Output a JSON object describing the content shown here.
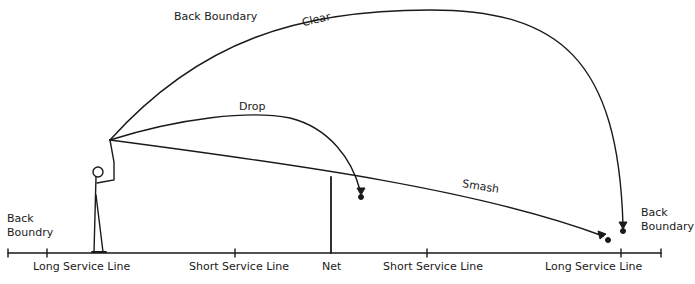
{
  "diagram": {
    "type": "badminton-shot-trajectories",
    "line_color": "#1a1a1a",
    "background": "#ffffff",
    "shots": [
      {
        "name": "Clear",
        "label": "Clear"
      },
      {
        "name": "Drop",
        "label": "Drop"
      },
      {
        "name": "Smash",
        "label": "Smash"
      }
    ],
    "labels": {
      "back_boundary_top": "Back Boundary",
      "back_boundary_left": "Back\nBoundry",
      "back_boundary_right": "Back\nBoundary",
      "clear": "Clear",
      "drop": "Drop",
      "smash": "Smash"
    },
    "court_lines": [
      {
        "label": "Long Service Line"
      },
      {
        "label": "Short Service Line"
      },
      {
        "label": "Net"
      },
      {
        "label": "Short Service Line"
      },
      {
        "label": "Long Service Line"
      }
    ]
  }
}
